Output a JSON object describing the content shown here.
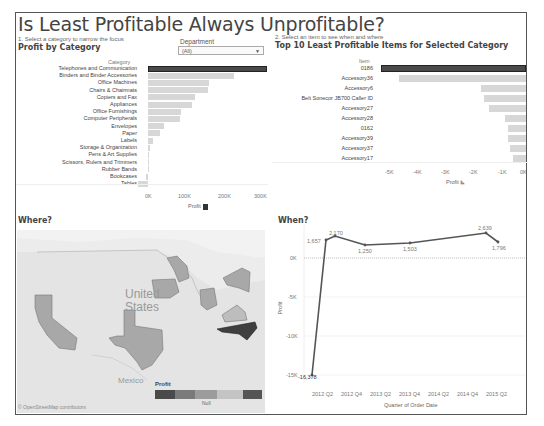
{
  "dashboard": {
    "title": "Is Least Profitable Always Unprofitable?",
    "step1": "1. Select a category to narrow the focus",
    "step2": "2. Select an item to see when and where",
    "department_filter": {
      "label": "Department",
      "value": "(All)"
    }
  },
  "profit_by_category": {
    "header": "Profit by Category",
    "column_header": "Category",
    "x_axis_title": "Profit",
    "ticks": [
      "0K",
      "100K",
      "200K",
      "300K"
    ]
  },
  "top10": {
    "header": "Top 10 Least Profitable Items for Selected Category",
    "column_header": "Item",
    "x_axis_title": "Profit",
    "ticks": [
      "-5K",
      "-4K",
      "-3K",
      "-2K",
      "-1K",
      "0K"
    ]
  },
  "where": {
    "header": "Where?",
    "country_label_1": "United",
    "country_label_2": "States",
    "mexico_label": "Mexico",
    "attribution": "© OpenStreetMap contributors",
    "legend_title": "Profit",
    "legend_null": "Null"
  },
  "when": {
    "header": "When?",
    "y_axis_title": "Profit",
    "x_axis_title": "Quarter of Order Date",
    "y_ticks": [
      "0K",
      "-5K",
      "-10K",
      "-15K"
    ],
    "x_ticks": [
      "2012 Q2",
      "2012 Q4",
      "2013 Q2",
      "2013 Q4",
      "2014 Q2",
      "2014 Q4",
      "2015 Q2"
    ]
  },
  "colors": {
    "selected": "#4a4a4a",
    "bar": "#d7d7d7",
    "map_state": "#a8a8a8",
    "map_state_dark": "#555555",
    "line": "#555555"
  },
  "chart_data": [
    {
      "type": "bar",
      "title": "Profit by Category",
      "xlabel": "Profit",
      "ylabel": "Category",
      "categories": [
        "Telephones and Communication",
        "Binders and Binder Accessories",
        "Office Machines",
        "Chairs & Chairmats",
        "Copiers and Fax",
        "Appliances",
        "Office Furnishings",
        "Computer Peripherals",
        "Envelopes",
        "Paper",
        "Labels",
        "Storage & Organization",
        "Pens & Art Supplies",
        "Scissors, Rulers and Trimmers",
        "Rubber Bands",
        "Bookcases",
        "Tables"
      ],
      "values": [
        316000,
        228000,
        163000,
        160000,
        125000,
        116000,
        87000,
        85000,
        42000,
        32000,
        14000,
        6000,
        3000,
        1000,
        500,
        -4000,
        -26000
      ],
      "xlim": [
        -30000,
        320000
      ],
      "selected": "Telephones and Communication"
    },
    {
      "type": "bar",
      "title": "Top 10 Least Profitable Items for Selected Category",
      "xlabel": "Profit",
      "ylabel": "Item",
      "categories": [
        "0186",
        "Accessory36",
        "Accessory6",
        "Belt Sonecor JB700 Caller ID",
        "Accessory27",
        "Accessory28",
        "0162",
        "Accessory39",
        "Accessory37",
        "Accessory17"
      ],
      "values": [
        -5500,
        -4800,
        -1700,
        -1600,
        -1400,
        -800,
        -700,
        -700,
        -600,
        -500
      ],
      "xlim": [
        -5500,
        0
      ],
      "selected": "0186"
    },
    {
      "type": "line",
      "title": "When?",
      "xlabel": "Quarter of Order Date",
      "ylabel": "Profit",
      "x": [
        "2012 Q2",
        "2012 Q3",
        "2012 Q4",
        "2013 Q3",
        "2014 Q1",
        "2015 Q2",
        "2015 Q3"
      ],
      "values": [
        -16378,
        1657,
        2170,
        1250,
        1503,
        2639,
        1796
      ],
      "point_labels": [
        "-16,378",
        "1,657",
        "2,170",
        "1,250",
        "1,503",
        "2,639",
        "1,796"
      ],
      "ylim": [
        -17000,
        3500
      ]
    }
  ]
}
